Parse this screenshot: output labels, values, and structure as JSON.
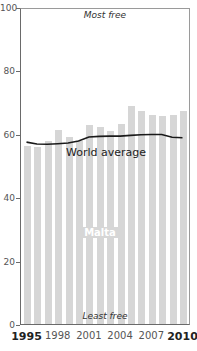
{
  "chart_data": {
    "type": "bar",
    "title": "",
    "xlabel": "",
    "ylabel": "",
    "ylim": [
      0,
      100
    ],
    "yticks": [
      0,
      20,
      40,
      60,
      80,
      100
    ],
    "xtick_labels": [
      "1995",
      "1998",
      "2001",
      "2004",
      "2007",
      "2010"
    ],
    "categories": [
      "1995",
      "1996",
      "1997",
      "1998",
      "1999",
      "2000",
      "2001",
      "2002",
      "2003",
      "2004",
      "2005",
      "2006",
      "2007",
      "2008",
      "2009",
      "2010"
    ],
    "series": [
      {
        "name": "Malta",
        "type": "bar",
        "color": "#d6d6d6",
        "values": [
          56.2,
          55.7,
          57.6,
          61.2,
          59.1,
          57.8,
          62.8,
          62.1,
          61.0,
          63.1,
          68.9,
          67.1,
          66.0,
          65.7,
          66.0,
          67.1
        ]
      },
      {
        "name": "World average",
        "type": "line",
        "color": "#1a1a1a",
        "values": [
          57.7,
          57.1,
          57.0,
          57.2,
          57.4,
          58.0,
          59.3,
          59.5,
          59.6,
          59.6,
          59.8,
          60.0,
          60.1,
          60.1,
          59.2,
          59.1
        ]
      }
    ],
    "annotations": [
      "Most free",
      "Least free",
      "World average",
      "Malta"
    ],
    "grid": false,
    "legend": "inline labels"
  },
  "labels": {
    "top": "Most free",
    "bottom": "Least free",
    "line": "World average",
    "bars": "Malta"
  },
  "yticks": [
    "100",
    "80",
    "60",
    "40",
    "20",
    "0"
  ],
  "xticks": [
    "1995",
    "1998",
    "2001",
    "2004",
    "2007",
    "2010"
  ]
}
